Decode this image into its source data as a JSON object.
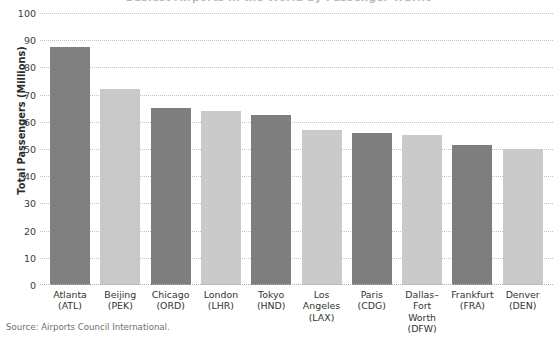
{
  "figure": {
    "title_clipped": "Busiest Airports in the World by Passenger Traffic",
    "source_note": "Source: Airports Council International."
  },
  "chart_data": {
    "type": "bar",
    "title": "",
    "xlabel": "",
    "ylabel": "Total Passengers (Millions)",
    "ylim": [
      0,
      100
    ],
    "ytick_step": 10,
    "yticks": [
      100,
      90,
      80,
      70,
      60,
      50,
      40,
      30,
      20,
      10,
      0
    ],
    "ytick_labels": [
      "100",
      "90",
      "80",
      "70",
      "60",
      "50",
      "40",
      "30",
      "20",
      "10",
      "0"
    ],
    "grid": true,
    "grid_axis": "y",
    "grid_style": "dotted",
    "legend": "none",
    "categories": [
      "Atlanta (ATL)",
      "Beijing (PEK)",
      "Chicago (ORD)",
      "London (LHR)",
      "Tokyo (HND)",
      "Los Angeles (LAX)",
      "Paris (CDG)",
      "Dallas-Fort Worth (DFW)",
      "Frankfurt (FRA)",
      "Denver (DEN)"
    ],
    "category_lines": [
      [
        "Atlanta",
        "(ATL)"
      ],
      [
        "Beijing",
        "(PEK)"
      ],
      [
        "Chicago",
        "(ORD)"
      ],
      [
        "London",
        "(LHR)"
      ],
      [
        "Tokyo",
        "(HND)"
      ],
      [
        "Los",
        "Angeles",
        "(LAX)"
      ],
      [
        "Paris",
        "(CDG)"
      ],
      [
        "Dallas–",
        "Fort",
        "Worth",
        "(DFW)"
      ],
      [
        "Frankfurt",
        "(FRA)"
      ],
      [
        "Denver",
        "(DEN)"
      ]
    ],
    "values": [
      87.5,
      72,
      65,
      64,
      62.5,
      57,
      56,
      55,
      51.5,
      50
    ],
    "bar_colors": [
      "#808080",
      "#c9c9c9",
      "#7e7e7e",
      "#cacaca",
      "#7e7e7e",
      "#cacaca",
      "#7e7e7e",
      "#cacaca",
      "#7e7e7e",
      "#cacaca"
    ],
    "colors": {
      "dark_bar": "#808080",
      "light_bar": "#c9c9c9",
      "gridline": "#c4c4c4",
      "text": "#333333",
      "source_text": "#6f6f6f",
      "background": "#ffffff"
    }
  }
}
